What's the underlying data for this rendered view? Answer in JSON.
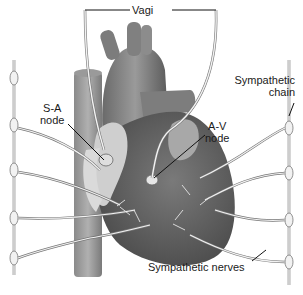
{
  "figure": {
    "labels": {
      "vagi": "Vagi",
      "sympathetic_chain_line1": "Sympathetic",
      "sympathetic_chain_line2": "chain",
      "sa_node_line1": "S-A",
      "sa_node_line2": "node",
      "av_node_line1": "A-V",
      "av_node_line2": "node",
      "sympathetic_nerves": "Sympathetic nerves"
    },
    "colors": {
      "background": "#ffffff",
      "heart_dark": "#5e5e5e",
      "heart_mid": "#858585",
      "heart_light": "#b9b9b9",
      "atrium_light": "#d2d2d2",
      "nerve": "#f2f2f2",
      "nerve_outline": "#777777",
      "leader_line": "#111111"
    }
  }
}
